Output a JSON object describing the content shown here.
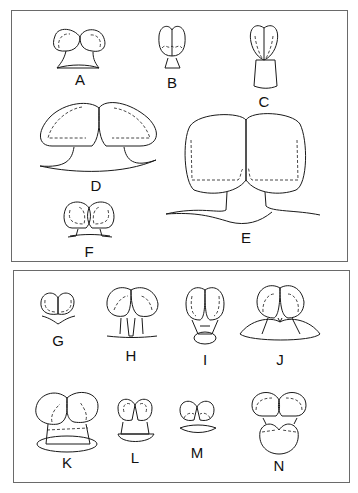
{
  "figure": {
    "panels": [
      {
        "id": "top",
        "figures": [
          {
            "label": "A",
            "x": 80,
            "y": 70
          },
          {
            "label": "B",
            "x": 172,
            "y": 72
          },
          {
            "label": "C",
            "x": 264,
            "y": 92
          },
          {
            "label": "D",
            "x": 96,
            "y": 175
          },
          {
            "label": "E",
            "x": 246,
            "y": 228
          },
          {
            "label": "F",
            "x": 89,
            "y": 245
          }
        ]
      },
      {
        "id": "bottom",
        "figures": [
          {
            "label": "G",
            "x": 58,
            "y": 340
          },
          {
            "label": "H",
            "x": 131,
            "y": 354
          },
          {
            "label": "I",
            "x": 205,
            "y": 357
          },
          {
            "label": "J",
            "x": 280,
            "y": 357
          },
          {
            "label": "K",
            "x": 67,
            "y": 460
          },
          {
            "label": "L",
            "x": 135,
            "y": 455
          },
          {
            "label": "M",
            "x": 197,
            "y": 449
          },
          {
            "label": "N",
            "x": 279,
            "y": 461
          }
        ]
      }
    ]
  },
  "labels": {
    "A": "A",
    "B": "B",
    "C": "C",
    "D": "D",
    "E": "E",
    "F": "F",
    "G": "G",
    "H": "H",
    "I": "I",
    "J": "J",
    "K": "K",
    "L": "L",
    "M": "M",
    "N": "N"
  }
}
